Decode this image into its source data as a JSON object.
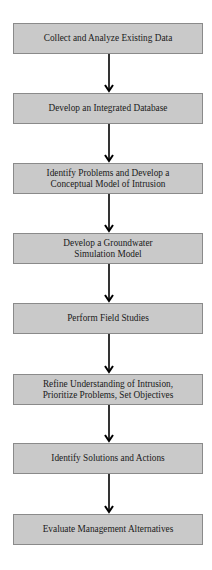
{
  "flowchart": {
    "steps": [
      {
        "label": "Collect and Analyze Existing Data"
      },
      {
        "label": "Develop an Integrated Database"
      },
      {
        "label": "Identify Problems and Develop a\nConceptual Model of Intrusion"
      },
      {
        "label": "Develop a Groundwater\nSimulation Model"
      },
      {
        "label": "Perform Field Studies"
      },
      {
        "label": "Refine Understanding of Intrusion,\nPrioritize Problems, Set Objectives"
      },
      {
        "label": "Identify Solutions and Actions"
      },
      {
        "label": "Evaluate Management Alternatives"
      }
    ],
    "colors": {
      "box_fill": "#c9c9c9",
      "box_border": "#8a8a8a",
      "arrow": "#000000",
      "text": "#1a1a1a"
    }
  }
}
